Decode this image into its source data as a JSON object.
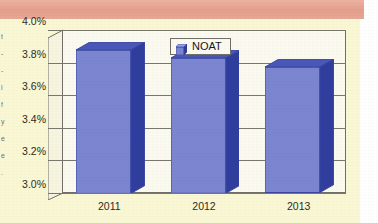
{
  "page": {
    "background_color": "#f9f7d4",
    "banner_color": "#e8a694",
    "margin_color": "#ffffff",
    "margin_text_fragments": [
      "t",
      "-",
      "-",
      "l",
      "f",
      "y",
      "e",
      "e",
      "."
    ]
  },
  "chart_data": {
    "type": "bar",
    "title": "",
    "subtitle": "",
    "xlabel": "",
    "ylabel": "",
    "categories": [
      "2011",
      "2012",
      "2013"
    ],
    "values": [
      3.88,
      3.83,
      3.77
    ],
    "value_suffix": "%",
    "series": [
      {
        "name": "NOAT",
        "values": [
          3.88,
          3.83,
          3.77
        ],
        "color": "#7b85d0"
      }
    ],
    "ylim": [
      3.0,
      4.0
    ],
    "ytick_values": [
      4.0,
      3.8,
      3.6,
      3.4,
      3.2,
      3.0
    ],
    "ytick_labels": [
      "4.0%",
      "3.8%",
      "3.6%",
      "3.4%",
      "3.2%",
      "3.0%"
    ],
    "xtick_labels": [
      "2011",
      "2012",
      "2013"
    ],
    "grid": true,
    "grid_axis": "y",
    "legend": {
      "visible": true,
      "position": "top-center",
      "entries": [
        {
          "label": "NOAT",
          "color": "#7b85d0",
          "icon": "legend-swatch-cube-icon"
        }
      ]
    },
    "style": {
      "three_d": true,
      "bar_face_color": "#7b85d0",
      "bar_side_color": "#2f3d9e",
      "bar_top_color": "#4a57b8",
      "bar_border_color": "#3a46a4",
      "plot_background": "#fbfaf0",
      "axis_color": "#6f6f68",
      "grid_color": "#77776e",
      "tick_label_color": "#2c2c24"
    }
  }
}
